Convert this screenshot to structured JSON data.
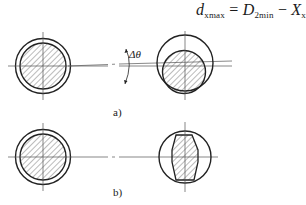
{
  "formula": {
    "lhs_symbol": "d",
    "lhs_sub": "xmax",
    "equals": " = ",
    "term1_symbol": "D",
    "term1_sub": "2min",
    "minus": " − ",
    "term2_symbol": "X",
    "term2_sub": "xmin"
  },
  "figure_a": {
    "label": "a)",
    "angle_label": "Δθ",
    "left_part": "shaft in bore, concentric (hatched section)",
    "right_part": "shaft offset within bore, tilted axis"
  },
  "figure_b": {
    "label": "b)",
    "left_part": "shaft in bore, concentric (hatched section)",
    "right_part": "flattened/barrel-shaped shaft section within bore"
  },
  "colors": {
    "line": "#222222",
    "center_line": "#555555",
    "hatch": "#555555",
    "background": "#ffffff"
  }
}
